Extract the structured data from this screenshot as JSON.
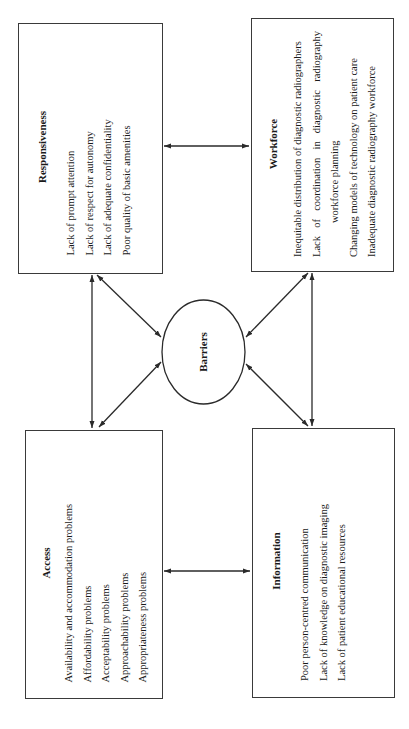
{
  "diagram": {
    "orientation": "rotated -90deg (text reads bottom-to-top)",
    "center": {
      "label": "Barriers",
      "shape": "ellipse"
    },
    "boxes": {
      "responsiveness": {
        "title": "Responsiveness",
        "items": [
          "Lack of prompt attention",
          "Lack of respect for autonomy",
          "Lack of adequate confidentiality",
          "Poor quality of basic amenities"
        ]
      },
      "workforce": {
        "title": "Workforce",
        "items": [
          "Inequitable distribution of diagnostic radiographers",
          "Lack of coordination in diagnostic radiography workforce planning",
          "Changing models of technology on patient care",
          "Inadequate diagnostic radiography workforce"
        ],
        "item2_line1_words": [
          "Lack",
          "of",
          "coordination",
          "in",
          "diagnostic",
          "radiography"
        ],
        "item2_line2": "workforce planning"
      },
      "access": {
        "title": "Access",
        "items": [
          "Availability and accommodation problems",
          "Affordability problems",
          "Acceptability problems",
          "Approachability problems",
          "Appropriateness problems"
        ]
      },
      "information": {
        "title": "Information",
        "items": [
          "Poor person-centred communication",
          "Lack of knowledge on diagnostic imaging",
          "Lack of patient educational resources"
        ]
      }
    },
    "connections": [
      {
        "from": "responsiveness",
        "to": "workforce",
        "type": "bidirectional"
      },
      {
        "from": "access",
        "to": "information",
        "type": "bidirectional"
      },
      {
        "from": "responsiveness",
        "to": "access",
        "type": "bidirectional"
      },
      {
        "from": "workforce",
        "to": "information",
        "type": "bidirectional"
      },
      {
        "from": "responsiveness",
        "to": "barriers",
        "type": "bidirectional"
      },
      {
        "from": "access",
        "to": "barriers",
        "type": "bidirectional"
      },
      {
        "from": "workforce",
        "to": "barriers",
        "type": "bidirectional"
      },
      {
        "from": "information",
        "to": "barriers",
        "type": "bidirectional"
      }
    ],
    "colors": {
      "line": "#2a2a2a",
      "text": "#1a1a1a",
      "background": "#ffffff"
    }
  }
}
